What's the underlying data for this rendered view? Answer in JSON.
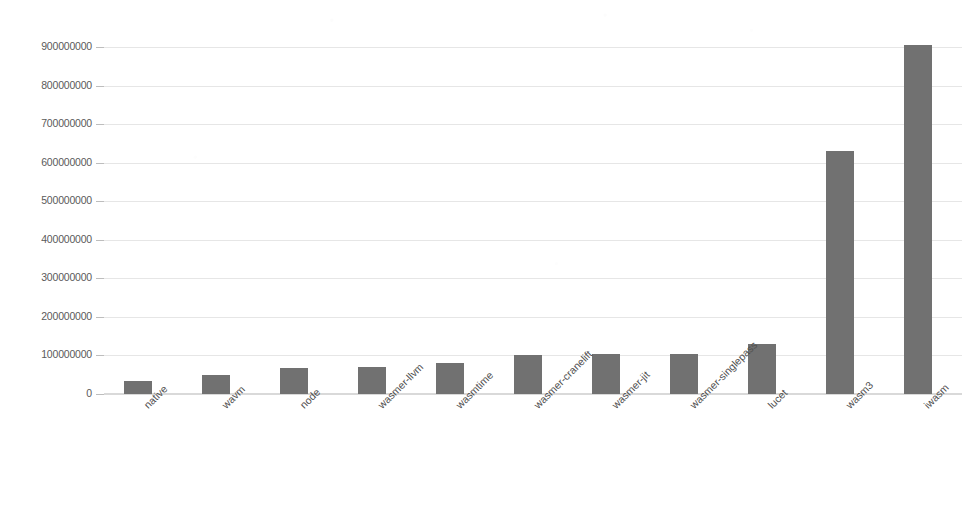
{
  "chart_data": {
    "type": "bar",
    "title": "",
    "subtitle": "",
    "xlabel": "",
    "ylabel": "",
    "categories": [
      "native",
      "wavm",
      "node",
      "wasmer-llvm",
      "wasmtime",
      "wasmer-cranelift",
      "wasmer-jit",
      "wasmer-singlepass",
      "lucet",
      "wasm3",
      "iwasm"
    ],
    "values": [
      33000000,
      50000000,
      67000000,
      70000000,
      80000000,
      100000000,
      103000000,
      103000000,
      130000000,
      630000000,
      905000000
    ],
    "ytick_labels": [
      "0",
      "100000000",
      "200000000",
      "300000000",
      "400000000",
      "500000000",
      "600000000",
      "700000000",
      "800000000",
      "900000000"
    ],
    "ytick_values": [
      0,
      100000000,
      200000000,
      300000000,
      400000000,
      500000000,
      600000000,
      700000000,
      800000000,
      900000000
    ],
    "ylim": [
      0,
      935000000
    ],
    "grid": true,
    "legend": false,
    "legend_position": "none",
    "series": [
      {
        "name": "runtime",
        "values": [
          33000000,
          50000000,
          67000000,
          70000000,
          80000000,
          100000000,
          103000000,
          103000000,
          130000000,
          630000000,
          905000000
        ]
      }
    ]
  },
  "style": {
    "bar_color": "#717171",
    "grid_color": "#e6e6e6",
    "axis_color": "#d9d9d9",
    "tick_label_color": "#5a5a5a",
    "background_color": "#ffffff"
  }
}
